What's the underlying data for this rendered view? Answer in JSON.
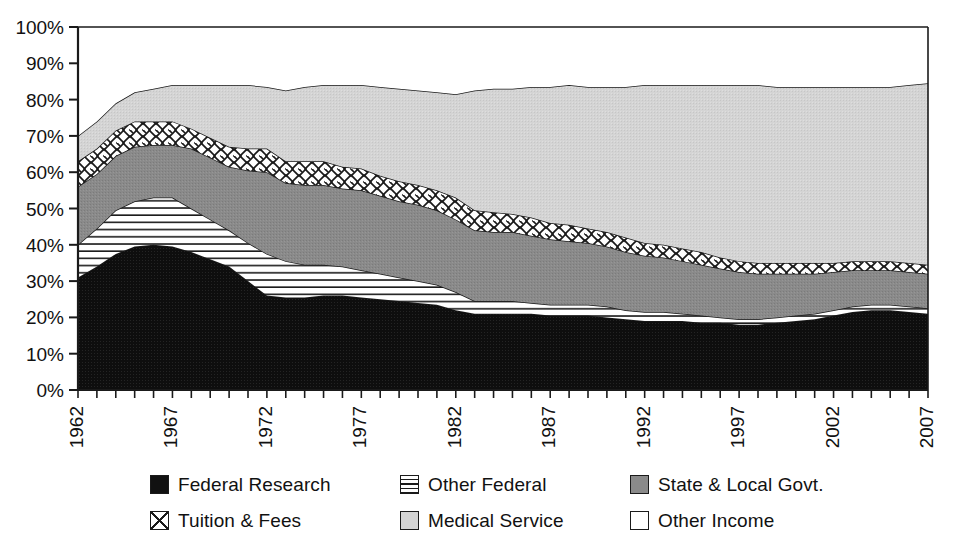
{
  "chart_data": {
    "type": "area",
    "title": "",
    "subtitle": "",
    "xlabel": "",
    "ylabel": "",
    "stacked": true,
    "percent_stacked": true,
    "grid": false,
    "legend_position": "bottom",
    "xlim": [
      1962,
      2007
    ],
    "ylim": [
      0,
      100
    ],
    "ytick_labels": [
      "0%",
      "10%",
      "20%",
      "30%",
      "40%",
      "50%",
      "60%",
      "70%",
      "80%",
      "90%",
      "100%"
    ],
    "ytick_values": [
      0,
      10,
      20,
      30,
      40,
      50,
      60,
      70,
      80,
      90,
      100
    ],
    "xtick_labels": [
      "1962",
      "1967",
      "1972",
      "1977",
      "1982",
      "1987",
      "1992",
      "1997",
      "2002",
      "2007"
    ],
    "xtick_values": [
      1962,
      1967,
      1972,
      1977,
      1982,
      1987,
      1992,
      1997,
      2002,
      2007
    ],
    "x": [
      1962,
      1963,
      1964,
      1965,
      1966,
      1967,
      1968,
      1969,
      1970,
      1971,
      1972,
      1973,
      1974,
      1975,
      1976,
      1977,
      1978,
      1979,
      1980,
      1981,
      1982,
      1983,
      1984,
      1985,
      1986,
      1987,
      1988,
      1989,
      1990,
      1991,
      1992,
      1993,
      1994,
      1995,
      1996,
      1997,
      1998,
      1999,
      2000,
      2001,
      2002,
      2003,
      2004,
      2005,
      2006,
      2007
    ],
    "series": [
      {
        "name": "Federal Research",
        "pattern": "solid-black",
        "color": "#111111",
        "values": [
          31.0,
          34.0,
          37.5,
          39.5,
          40.0,
          39.5,
          38.0,
          36.0,
          34.0,
          30.0,
          26.0,
          25.5,
          25.5,
          26.0,
          26.0,
          25.5,
          25.0,
          24.5,
          24.0,
          23.5,
          22.0,
          21.0,
          21.0,
          21.0,
          21.0,
          20.5,
          20.5,
          20.5,
          20.0,
          19.5,
          19.0,
          19.0,
          19.0,
          18.5,
          18.5,
          18.0,
          18.0,
          18.5,
          19.0,
          19.5,
          20.5,
          21.5,
          22.0,
          22.0,
          21.5,
          21.0
        ]
      },
      {
        "name": "Other Federal",
        "pattern": "horizontal-lines",
        "color": "#ffffff",
        "values": [
          9.0,
          10.5,
          12.0,
          12.5,
          13.0,
          13.5,
          12.0,
          11.0,
          10.0,
          10.5,
          11.5,
          10.0,
          9.0,
          8.5,
          8.0,
          7.5,
          7.0,
          6.5,
          6.0,
          5.5,
          5.0,
          3.5,
          3.5,
          3.5,
          3.0,
          3.0,
          3.0,
          3.0,
          3.0,
          2.5,
          2.5,
          2.5,
          2.0,
          2.0,
          1.5,
          1.5,
          1.5,
          1.5,
          1.5,
          1.5,
          1.5,
          1.5,
          1.5,
          1.5,
          1.5,
          1.5
        ]
      },
      {
        "name": "State & Local Govt.",
        "pattern": "solid-gray",
        "color": "#888888",
        "values": [
          16.0,
          15.0,
          15.0,
          15.0,
          14.5,
          14.5,
          16.5,
          17.0,
          17.5,
          20.0,
          22.5,
          21.5,
          22.0,
          22.0,
          21.5,
          22.0,
          21.5,
          21.0,
          21.0,
          20.5,
          20.0,
          19.5,
          19.0,
          19.0,
          18.5,
          18.0,
          17.5,
          17.0,
          16.5,
          16.0,
          15.5,
          15.0,
          14.5,
          14.0,
          13.5,
          13.0,
          12.5,
          12.0,
          11.5,
          11.0,
          10.5,
          10.0,
          9.5,
          9.5,
          9.5,
          9.5
        ]
      },
      {
        "name": "Tuition & Fees",
        "pattern": "cross-hatch",
        "color": "#ffffff",
        "values": [
          7.0,
          7.0,
          7.0,
          7.0,
          6.5,
          6.5,
          5.5,
          5.5,
          5.5,
          6.0,
          6.5,
          6.0,
          6.5,
          6.5,
          6.0,
          6.0,
          5.5,
          5.5,
          5.5,
          5.5,
          6.0,
          5.5,
          5.5,
          5.0,
          5.0,
          4.5,
          4.5,
          4.0,
          4.0,
          4.0,
          3.5,
          3.5,
          3.5,
          3.5,
          3.0,
          3.0,
          3.0,
          3.0,
          3.0,
          3.0,
          2.5,
          2.5,
          2.5,
          2.5,
          2.5,
          2.5
        ]
      },
      {
        "name": "Medical Service",
        "pattern": "solid-light-gray",
        "color": "#d2d2d2",
        "values": [
          7.0,
          7.5,
          7.5,
          8.0,
          9.0,
          10.0,
          12.0,
          14.5,
          17.0,
          17.5,
          17.0,
          19.5,
          20.5,
          21.0,
          22.5,
          23.0,
          24.5,
          25.5,
          26.0,
          27.0,
          28.5,
          33.0,
          34.0,
          34.5,
          36.0,
          37.5,
          38.5,
          39.0,
          40.0,
          41.5,
          43.5,
          44.0,
          45.0,
          46.0,
          47.5,
          48.5,
          49.0,
          48.5,
          48.5,
          48.5,
          48.5,
          48.0,
          48.0,
          48.0,
          49.0,
          50.0
        ]
      },
      {
        "name": "Other Income",
        "pattern": "white",
        "color": "#ffffff",
        "values": [
          30.0,
          26.0,
          21.0,
          18.0,
          17.0,
          16.0,
          16.0,
          16.0,
          16.0,
          16.0,
          16.5,
          17.5,
          16.5,
          16.0,
          16.0,
          16.0,
          16.5,
          17.0,
          17.5,
          18.0,
          18.5,
          17.5,
          17.0,
          17.0,
          16.5,
          16.5,
          16.0,
          16.5,
          16.5,
          15.5,
          16.0,
          16.0,
          16.0,
          16.0,
          16.0,
          16.0,
          16.0,
          16.5,
          16.5,
          16.5,
          16.5,
          16.5,
          16.5,
          16.5,
          16.0,
          15.5
        ]
      }
    ]
  },
  "legend": {
    "items": [
      {
        "label": "Federal Research",
        "swatch": "solid-black"
      },
      {
        "label": "Other Federal",
        "swatch": "horizontal-lines"
      },
      {
        "label": "State & Local Govt.",
        "swatch": "solid-gray"
      },
      {
        "label": "Tuition & Fees",
        "swatch": "cross-hatch"
      },
      {
        "label": "Medical Service",
        "swatch": "solid-light-gray"
      },
      {
        "label": "Other Income",
        "swatch": "white"
      }
    ]
  },
  "colors": {
    "axis": "#1a1a1a",
    "federal_research": "#111111",
    "state_local": "#888888",
    "medical_service": "#d2d2d2",
    "background": "#ffffff"
  }
}
